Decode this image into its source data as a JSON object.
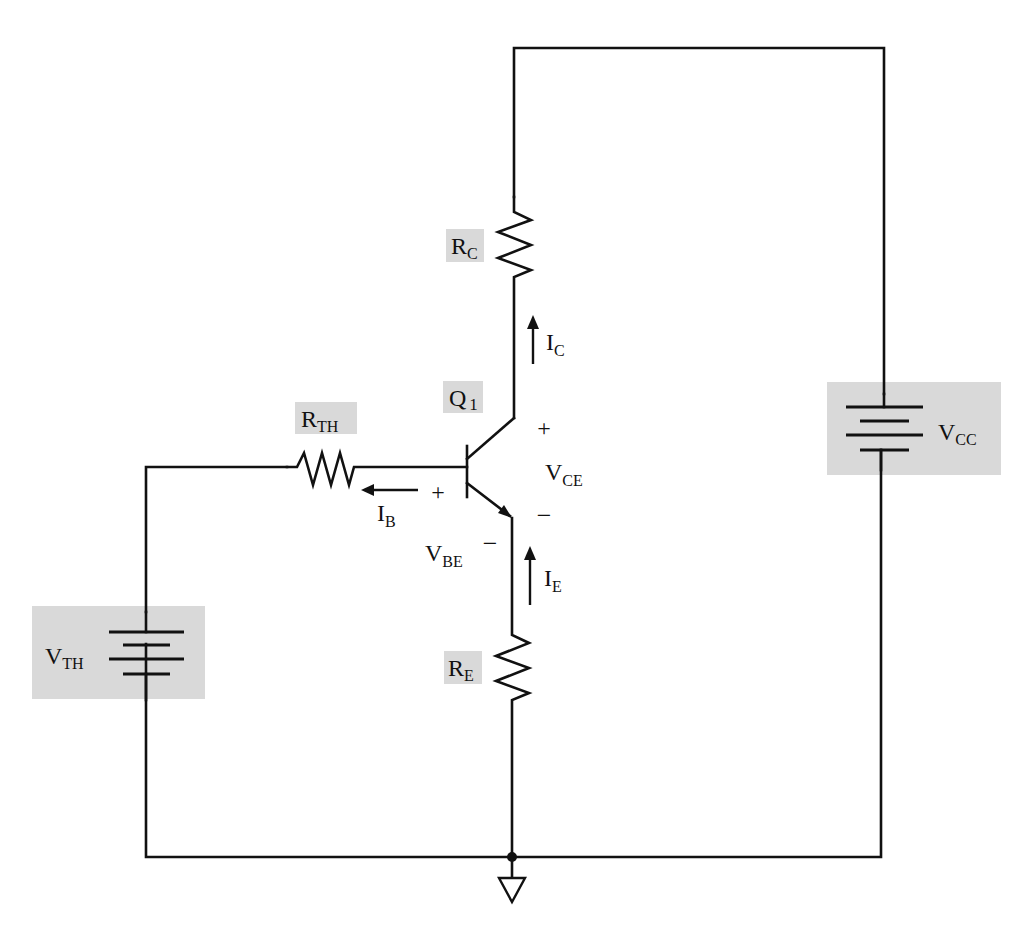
{
  "diagram": {
    "type": "circuit-schematic",
    "colors": {
      "wire": "#111111",
      "label_box": "#d9d9d9",
      "background": "#ffffff"
    },
    "components": {
      "r_th": {
        "name": "R",
        "sub": "TH"
      },
      "r_c": {
        "name": "R",
        "sub": "C"
      },
      "r_e": {
        "name": "R",
        "sub": "E"
      },
      "q1": {
        "name": "Q",
        "sub": "1"
      },
      "v_th": {
        "name": "V",
        "sub": "TH"
      },
      "v_cc": {
        "name": "V",
        "sub": "CC"
      }
    },
    "currents": {
      "i_b": {
        "name": "I",
        "sub": "B",
        "direction": "left (out of base toward R_TH)"
      },
      "i_c": {
        "name": "I",
        "sub": "C",
        "direction": "up (toward R_C)"
      },
      "i_e": {
        "name": "I",
        "sub": "E",
        "direction": "up (toward emitter)"
      }
    },
    "voltages": {
      "v_be": {
        "name": "V",
        "sub": "BE",
        "plus": "+",
        "minus": "−"
      },
      "v_ce": {
        "name": "V",
        "sub": "CE",
        "plus": "+",
        "minus": "−"
      }
    },
    "ground": {
      "symbol": "ground-triangle"
    }
  }
}
